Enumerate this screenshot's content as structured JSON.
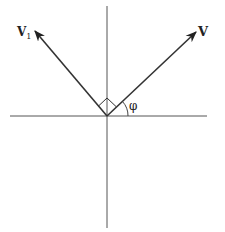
{
  "diagram": {
    "type": "vector-angle-diagram",
    "labels": {
      "v": "V",
      "v1_main": "V",
      "v1_sub": "1",
      "angle": "φ"
    },
    "colors": {
      "line": "#333333",
      "axis": "#555555",
      "background": "#ffffff"
    }
  }
}
